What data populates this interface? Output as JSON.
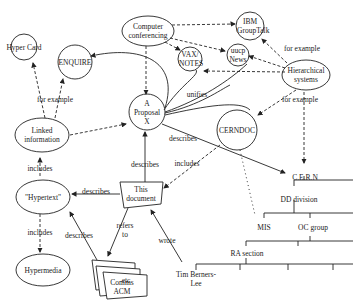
{
  "diagram": {
    "nodes": {
      "hypercard": "Hyper Card",
      "enquire": "ENQUIRE",
      "computer_conferencing": "Computer conferencing",
      "ibm_groupetalk": "IBM GroupTalk",
      "vax_notes": "VAX/ NOTES",
      "uucp_news": "uucp News",
      "hierarchical_systems": "Hierarchical systems",
      "linked_information": "Linked information",
      "proposal": "A Proposal X",
      "cerndoc": "CERNDOC",
      "hypertext": "\"Hypertext\"",
      "this_document": "This document",
      "hypermedia": "Hypermedia",
      "comms_acm": "Comms ACM",
      "etc": "etc",
      "cern": "C.E.R.N",
      "dd_division": "DD division",
      "mis": "MIS",
      "oc_group": "OC group",
      "ra_section": "RA section",
      "tim": "Tim Berners-Lee"
    },
    "edge_labels": {
      "for_example_1": "for example",
      "for_example_2": "for example",
      "for_example_3": "for example",
      "unifies": "unifies",
      "describes_cern": "describes",
      "includes_cerndoc": "includes",
      "describes_proposal": "describes",
      "includes_linked": "includes",
      "describes_hypertext": "describes",
      "includes_hypermedia": "includes",
      "describes_etc": "describes",
      "refers_to": "refers to",
      "wrote": "wrote"
    }
  }
}
